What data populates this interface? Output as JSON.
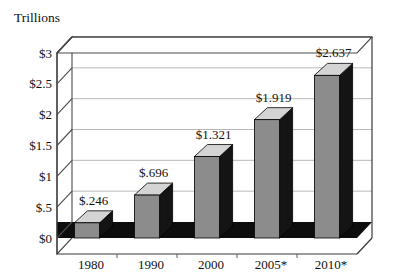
{
  "chart_data": {
    "type": "bar",
    "title": "",
    "subtitle": "",
    "ylabel": "Trillions",
    "xlabel": "",
    "categories": [
      "1980",
      "1990",
      "2000",
      "2005*",
      "2010*"
    ],
    "values": [
      0.246,
      0.696,
      1.321,
      1.919,
      2.637
    ],
    "data_labels": [
      "$.246",
      "$.696",
      "$1.321",
      "$1.919",
      "$2.637"
    ],
    "ylim": [
      0,
      3
    ],
    "ytick_values": [
      0,
      0.5,
      1,
      1.5,
      2,
      2.5,
      3
    ],
    "ytick_labels": [
      "$0",
      "$.5",
      "$1",
      "$1.5",
      "$2",
      "$2.5",
      "$3"
    ],
    "grid": true,
    "legend": false,
    "legend_position": "none",
    "style": "3d-column",
    "series": [
      {
        "name": "",
        "values": [
          0.246,
          0.696,
          1.321,
          1.919,
          2.637
        ]
      }
    ],
    "colors": {
      "bar_front": "#8c8c8c",
      "bar_top": "#d4d4d4",
      "bar_side": "#141414",
      "floor": "#0d0d0d",
      "gridline": "#b9b9b9",
      "frame": "#3a3a3a",
      "text": "#111111",
      "background": "#ffffff"
    }
  }
}
